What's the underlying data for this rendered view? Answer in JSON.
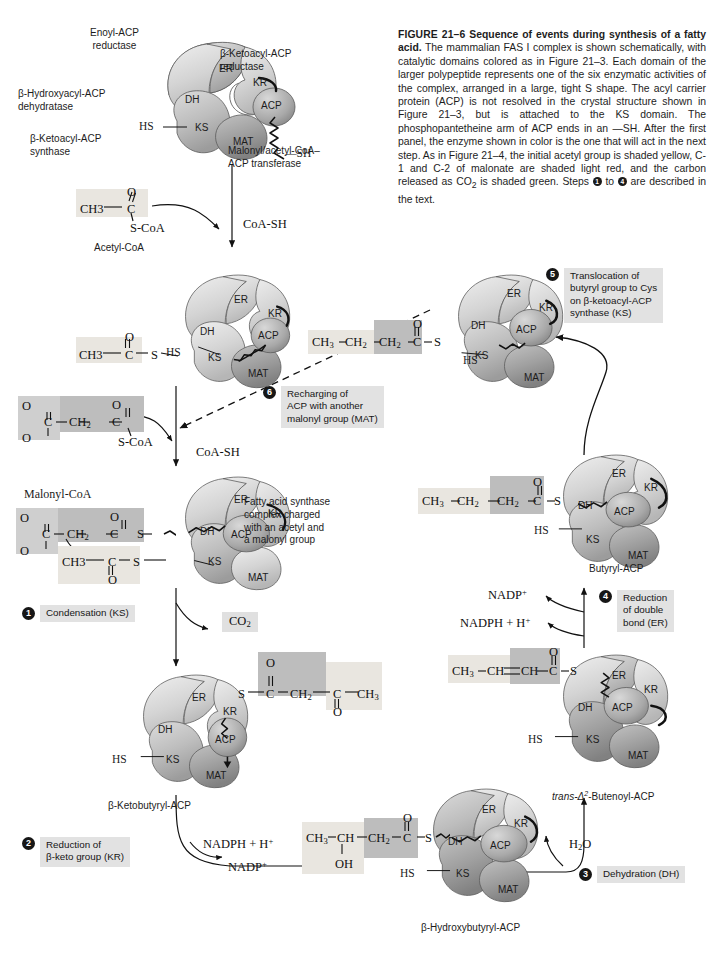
{
  "figure": {
    "label": "FIGURE 21–6",
    "title": "Sequence of events during synthesis of a fatty acid.",
    "body_1": " The mammalian FAS I complex is shown schematically, with catalytic domains colored as in Figure 21–3. Each domain of the larger polypeptide represents one of the six enzymatic activities of the complex, arranged in a large, tight S shape. The acyl carrier protein (ACP) is not resolved in the crystal structure shown in Figure 21–3, but is attached to the KS domain. The phosphopantetheine arm of ACP ends in an —SH. After the first panel, the enzyme shown in color is the one that will act in the next step. As in Figure 21–4, the initial acetyl group is shaded yellow, C-1 and C-2 of malonate are shaded light red, and the carbon released as CO",
    "body_sub": "2",
    "body_2": " is shaded green. Steps ",
    "step_from": "1",
    "body_3": " to ",
    "step_to": "4",
    "body_4": " are described in the text."
  },
  "domains": {
    "er": "ER",
    "kr": "KR",
    "dh": "DH",
    "ks": "KS",
    "mat": "MAT",
    "acp": "ACP",
    "hs": "HS",
    "sh": "—SH"
  },
  "enzyme_labels": {
    "enoyl_reductase_l1": "Enoyl-ACP",
    "enoyl_reductase_l2": "reductase",
    "ketoacyl_reductase_l1": "β-Ketoacyl-ACP",
    "ketoacyl_reductase_l2": "reductase",
    "hydroxyacyl_dehydratase_l1": "β-Hydroxyacyl-ACP",
    "hydroxyacyl_dehydratase_l2": "dehydratase",
    "ketoacyl_synthase_l1": "β-Ketoacyl-ACP",
    "ketoacyl_synthase_l2": "synthase",
    "mat_transferase_l1": "Malonyl/acetyl-CoA–",
    "mat_transferase_l2": "ACP transferase"
  },
  "steps": [
    {
      "num": "1",
      "text": "Condensation (KS)"
    },
    {
      "num": "2",
      "text_l1": "Reduction of",
      "text_l2": "β-keto group (KR)"
    },
    {
      "num": "3",
      "text": "Dehydration (DH)"
    },
    {
      "num": "4",
      "text_l1": "Reduction",
      "text_l2": "of double",
      "text_l3": "bond (ER)"
    },
    {
      "num": "5",
      "text_l1": "Translocation of",
      "text_l2": "butyryl group to Cys",
      "text_l3": "on β-ketoacyl-ACP",
      "text_l4": "synthase (KS)"
    },
    {
      "num": "6",
      "text_l1": "Recharging of",
      "text_l2": "ACP with another",
      "text_l3": "malonyl group (MAT)"
    }
  ],
  "molecule_names": {
    "acetyl_coa": "Acetyl-CoA",
    "malonyl_coa": "Malonyl-CoA",
    "ketobutyryl_acp": "β-Ketobutyryl-ACP",
    "hydroxybutyryl_acp": "β-Hydroxybutyryl-ACP",
    "butenoyl_acp_pre": "trans-Δ",
    "butenoyl_acp_sup": "2",
    "butenoyl_acp_post": "-Butenoyl-ACP",
    "butyryl_acp": "Butyryl-ACP"
  },
  "side_note": {
    "l1": "Fatty acid synthase",
    "l2": "complex charged",
    "l3": "with an acetyl and",
    "l4": "a malonyl group"
  },
  "cofactors": {
    "coash_1": "CoA-SH",
    "coash_2": "CoA-SH",
    "co2": "CO2",
    "nadph_h_1": "NADPH + H+",
    "nadp_1": "NADP+",
    "nadph_h_2": "NADPH + H+",
    "nadp_2": "NADP+",
    "h2o": "H2O"
  },
  "formulas": {
    "acetyl_coa": {
      "ch3": "CH3",
      "c": "C",
      "o": "O",
      "scoa": "S-CoA"
    },
    "acetyl_on_ks": {
      "ch3": "CH3",
      "c": "C",
      "o": "O",
      "s": "S"
    },
    "malonyl_coa_free": {
      "o_top": "O",
      "o_bot": "O",
      "c1": "C",
      "ch2": "CH2",
      "c2": "C",
      "o2": "O",
      "scoa": "S-CoA"
    },
    "charged_malonyl": {
      "o_top": "O",
      "o_bot": "O",
      "c1": "C",
      "ch2": "CH2",
      "c2": "C",
      "o2": "O",
      "s": "S"
    },
    "charged_acetyl": {
      "ch3": "CH3",
      "c": "C",
      "o": "O",
      "s": "S"
    },
    "ketobutyryl": {
      "s": "S",
      "c1": "C",
      "o1": "O",
      "ch2": "CH2",
      "c2": "C",
      "o2": "O",
      "ch3": "CH3"
    },
    "hydroxybutyryl": {
      "ch3": "CH3",
      "ch": "CH",
      "oh": "OH",
      "ch2": "CH2",
      "c": "C",
      "o": "O",
      "s": "S"
    },
    "butenoyl": {
      "ch3": "CH3",
      "ch_a": "CH",
      "ch_b": "CH",
      "c": "C",
      "o": "O",
      "s": "S"
    },
    "butyryl": {
      "ch3": "CH3",
      "ch2_a": "CH2",
      "ch2_b": "CH2",
      "c": "C",
      "o": "O",
      "s": "S"
    },
    "butyryl_ks": {
      "ch3": "CH3",
      "ch2_a": "CH2",
      "ch2_b": "CH2",
      "c": "C",
      "o": "O",
      "s": "S"
    }
  },
  "colors": {
    "shade_yellow": "#e9e6e0",
    "shade_red": "#bdbdbd",
    "shade_green": "#cfcfcf",
    "shade_grey": "#e0e0e0",
    "callout_bg": "#e2e2e2",
    "ink": "#1a1a1a",
    "domain_light": "#d9d9d9",
    "domain_mid": "#bcbcbc",
    "domain_dark": "#9a9a9a"
  }
}
